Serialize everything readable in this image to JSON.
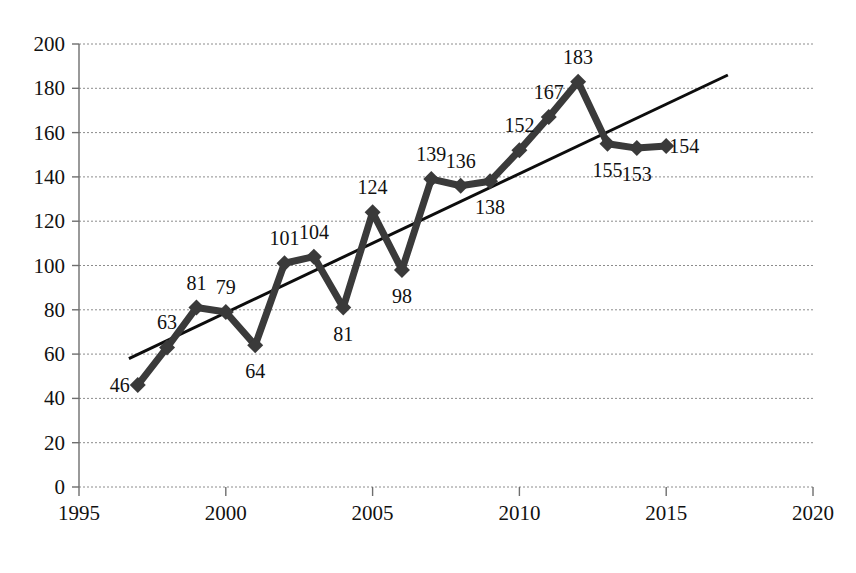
{
  "chart_data": {
    "type": "line",
    "title": "",
    "subtitle": "",
    "xlabel": "",
    "ylabel": "",
    "xlim": [
      1995,
      2020
    ],
    "ylim": [
      0,
      200
    ],
    "grid": true,
    "legend_position": "none",
    "x": [
      1997,
      1998,
      1999,
      2000,
      2001,
      2002,
      2003,
      2004,
      2005,
      2006,
      2007,
      2008,
      2009,
      2010,
      2011,
      2012,
      2013,
      2014,
      2015
    ],
    "values": [
      46,
      63,
      81,
      79,
      64,
      101,
      104,
      81,
      124,
      98,
      139,
      136,
      138,
      152,
      167,
      183,
      155,
      153,
      154
    ],
    "point_labels": [
      "46",
      "63",
      "81",
      "79",
      "64",
      "101",
      "104",
      "81",
      "124",
      "98",
      "139",
      "136",
      "138",
      "152",
      "167",
      "183",
      "155",
      "153",
      "154"
    ],
    "label_positions": [
      "left",
      "above",
      "above",
      "above",
      "below",
      "above",
      "above",
      "below",
      "above",
      "below",
      "above",
      "above",
      "below",
      "above",
      "above",
      "above",
      "below",
      "below",
      "right"
    ],
    "series": [
      {
        "name": "data-series",
        "values": [
          46,
          63,
          81,
          79,
          64,
          101,
          104,
          81,
          124,
          98,
          139,
          136,
          138,
          152,
          167,
          183,
          155,
          153,
          154
        ]
      }
    ],
    "trendline": {
      "type": "linear",
      "x_start": 1996.7,
      "y_start": 58,
      "x_end": 2017.1,
      "y_end": 186
    },
    "yticks": [
      0,
      20,
      40,
      60,
      80,
      100,
      120,
      140,
      160,
      180,
      200
    ],
    "ytick_labels": [
      "0",
      "20",
      "40",
      "60",
      "80",
      "100",
      "120",
      "140",
      "160",
      "180",
      "200"
    ],
    "xticks": [
      1995,
      2000,
      2005,
      2010,
      2015,
      2020
    ],
    "xtick_labels": [
      "1995",
      "2000",
      "2005",
      "2010",
      "2015",
      "2020"
    ],
    "colors": {
      "series": "#3a3a3a",
      "trendline": "#0d0d0d",
      "grid": "#8c8c8c",
      "axis": "#6e6e6e",
      "text": "#111111",
      "background": "#ffffff"
    }
  }
}
